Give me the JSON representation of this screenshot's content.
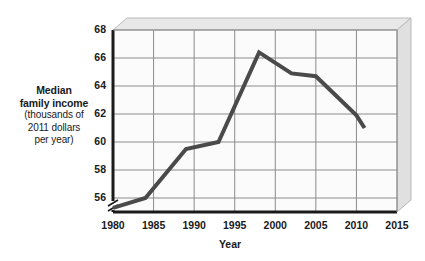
{
  "chart_data": {
    "type": "line",
    "title": "",
    "xlabel": "Year",
    "ylabel": "Median family income (thousands of 2011 dollars per year)",
    "ylabel_lines": [
      {
        "text": "Median",
        "bold": true
      },
      {
        "text": "family income",
        "bold": true
      },
      {
        "text": "(thousands of",
        "bold": false
      },
      {
        "text": "2011 dollars",
        "bold": false
      },
      {
        "text": "per year)",
        "bold": false
      }
    ],
    "xlim": [
      1980,
      2015
    ],
    "ylim": [
      55,
      68
    ],
    "y_axis_break": true,
    "y_axis_break_symbol": "//",
    "grid": true,
    "legend": "none",
    "x_ticks": [
      1980,
      1985,
      1990,
      1995,
      2000,
      2005,
      2010,
      2015
    ],
    "x_tick_labels": [
      "1980",
      "1985",
      "1990",
      "1995",
      "2000",
      "2005",
      "2010",
      "2015"
    ],
    "y_ticks": [
      56,
      58,
      60,
      62,
      64,
      66,
      68
    ],
    "y_tick_labels": [
      "56",
      "58",
      "60",
      "62",
      "64",
      "66",
      "68"
    ],
    "series": [
      {
        "name": "Median family income",
        "color": "#4a4a4a",
        "x": [
          1980,
          1984,
          1989,
          1993,
          1998,
          2002,
          2005,
          2010,
          2011
        ],
        "y": [
          55.3,
          56.0,
          59.5,
          60.0,
          66.4,
          64.9,
          64.7,
          61.9,
          61.0
        ]
      }
    ]
  },
  "style": {
    "line_color": "#4a4a4a",
    "panel_color": "#fbfbfb",
    "panel_top_color": "#e8e8e8",
    "panel_side_color": "#e0e0e0",
    "grid_color": "#8c8c8c",
    "axis_color": "#1a1a1a",
    "text_color": "#1a1a1a",
    "background": "#ffffff"
  },
  "icons": {
    "axis_break": "axis-break-icon"
  }
}
